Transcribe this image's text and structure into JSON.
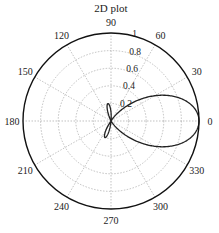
{
  "chart_data": {
    "type": "polar",
    "title": "2D plot",
    "angle_ticks": [
      "0",
      "30",
      "60",
      "90",
      "120",
      "150",
      "180",
      "210",
      "240",
      "270",
      "300",
      "330"
    ],
    "angle_tick_values": [
      0,
      30,
      60,
      90,
      120,
      150,
      180,
      210,
      240,
      270,
      300,
      330
    ],
    "radial_ticks": [
      "0.2",
      "0.4",
      "0.6",
      "0.8",
      "1"
    ],
    "radial_tick_values": [
      0.2,
      0.4,
      0.6,
      0.8,
      1.0
    ],
    "rlim": [
      0,
      1
    ],
    "grid": true,
    "series": [
      {
        "name": "pattern",
        "description": "Main lobe peaking at r=1 near 0 deg with ~+/-45 deg width; small back/side lobes ~0.2 near 100 deg and ~0.2 near 260 deg",
        "theta_deg": [
          -60,
          -50,
          -40,
          -30,
          -20,
          -10,
          0,
          10,
          20,
          30,
          40,
          50,
          60,
          80,
          95,
          100,
          105,
          120,
          180,
          240,
          255,
          260,
          265,
          280
        ],
        "r": [
          0.0,
          0.3,
          0.62,
          0.86,
          0.97,
          1.0,
          1.0,
          1.0,
          0.97,
          0.86,
          0.62,
          0.3,
          0.0,
          0.0,
          0.18,
          0.2,
          0.18,
          0.0,
          0.0,
          0.0,
          0.18,
          0.2,
          0.18,
          0.0
        ]
      }
    ]
  }
}
